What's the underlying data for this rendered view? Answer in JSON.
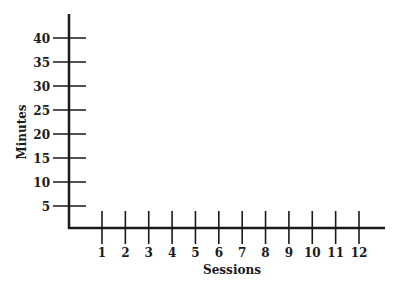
{
  "chart_data": {
    "type": "line",
    "title": "",
    "xlabel": "Sessions",
    "ylabel": "Minutes",
    "x": [
      1,
      2,
      3,
      4,
      5,
      6,
      7,
      8,
      9,
      10,
      11,
      12
    ],
    "x_tick_labels": [
      "1",
      "2",
      "3",
      "4",
      "5",
      "6",
      "7",
      "8",
      "9",
      "10",
      "11",
      "12"
    ],
    "y_tick_values": [
      5,
      10,
      15,
      20,
      25,
      30,
      35,
      40
    ],
    "y_tick_labels": [
      "5",
      "10",
      "15",
      "20",
      "25",
      "30",
      "35",
      "40"
    ],
    "series": [],
    "xlim": [
      0,
      13
    ],
    "ylim": [
      0,
      45
    ],
    "grid": false,
    "legend": null,
    "note": "Blank chart template with no plotted data"
  },
  "style": {
    "axis_color": "#1a1a1a",
    "background": "#ffffff"
  }
}
